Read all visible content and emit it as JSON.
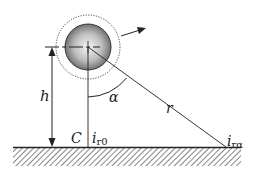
{
  "diagram": {
    "labels": {
      "height": "h",
      "angle": "α",
      "distance": "r",
      "point_c": "C",
      "current_zero_main": "i",
      "current_zero_sub": "r0",
      "current_alpha_main": "i",
      "current_alpha_sub": "rα"
    },
    "colors": {
      "stroke": "#222222",
      "sphere_light": "#f4f4f4",
      "sphere_dark": "#6a6a6a",
      "background": "#ffffff"
    },
    "elements": [
      "sphere",
      "dotted-orbit-circle",
      "velocity-arrow",
      "height-arrow",
      "vertical-line",
      "distance-line",
      "angle-arc",
      "ground-surface"
    ]
  }
}
